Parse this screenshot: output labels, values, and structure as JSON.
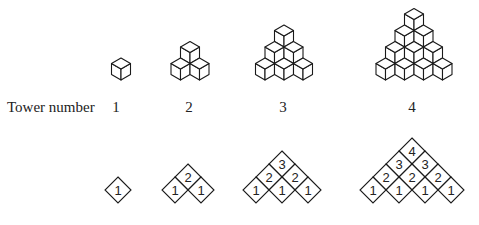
{
  "row_label": "Tower number",
  "towers": [
    {
      "number": "1",
      "center_x": 121,
      "label_x": 116,
      "rows": [
        [
          "1"
        ]
      ]
    },
    {
      "number": "2",
      "center_x": 190,
      "label_x": 189,
      "rows": [
        [
          "2"
        ],
        [
          "1",
          "1"
        ]
      ]
    },
    {
      "number": "3",
      "center_x": 284,
      "label_x": 283,
      "rows": [
        [
          "3"
        ],
        [
          "2",
          "2"
        ],
        [
          "1",
          "1",
          "1"
        ]
      ]
    },
    {
      "number": "4",
      "center_x": 414,
      "label_x": 412,
      "rows": [
        [
          "4"
        ],
        [
          "3",
          "3"
        ],
        [
          "2",
          "2",
          "2"
        ],
        [
          "1",
          "1",
          "1",
          "1"
        ]
      ]
    }
  ],
  "colors": {
    "stroke": "#1a1a1a",
    "text": "#222222",
    "background": "#ffffff"
  }
}
